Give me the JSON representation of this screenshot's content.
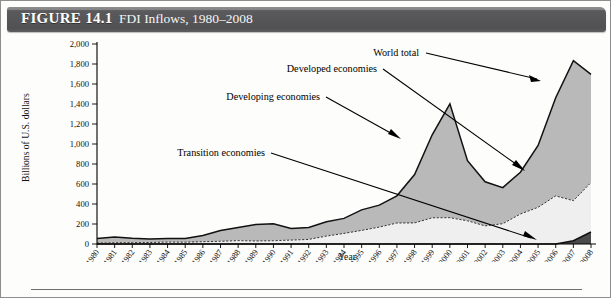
{
  "figure": {
    "label": "FIGURE 14.1",
    "title": "FDI Inflows, 1980–2008"
  },
  "colors": {
    "header_bar": "#58585a",
    "header_text": "#ffffff",
    "developed_band": "#b9b9b9",
    "developing_band": "#efefef",
    "transition_band": "#4a4a4a",
    "line": "#111111",
    "page_background": "#fdfdfb"
  },
  "annotations": {
    "world_total": "World total",
    "developed": "Developed economies",
    "developing": "Developing economies",
    "transition": "Transition economies"
  },
  "chart_data": {
    "type": "area",
    "title": "FDI Inflows, 1980–2008",
    "xlabel": "Year",
    "ylabel": "Billions of U.S. dollars",
    "ylim": [
      0,
      2000
    ],
    "yticks": [
      "0",
      "200",
      "400",
      "600",
      "800",
      "1,000",
      "1,200",
      "1,400",
      "1,600",
      "1,800",
      "2,000"
    ],
    "ytick_values": [
      0,
      200,
      400,
      600,
      800,
      1000,
      1200,
      1400,
      1600,
      1800,
      2000
    ],
    "grid": false,
    "legend": "annotated-labels-with-arrows",
    "x": [
      "1980",
      "1981",
      "1982",
      "1983",
      "1984",
      "1985",
      "1986",
      "1987",
      "1988",
      "1989",
      "1990",
      "1991",
      "1992",
      "1993",
      "1994",
      "1995",
      "1996",
      "1997",
      "1998",
      "1999",
      "2000",
      "2001",
      "2002",
      "2003",
      "2004",
      "2005",
      "2006",
      "2007",
      "2008"
    ],
    "series": [
      {
        "name": "World total",
        "style": "solid-line-upper-boundary",
        "values": [
          55,
          70,
          58,
          50,
          56,
          56,
          86,
          135,
          164,
          196,
          203,
          155,
          166,
          222,
          256,
          341,
          389,
          482,
          694,
          1092,
          1401,
          833,
          622,
          564,
          718,
          986,
          1463,
          1833,
          1697
        ]
      },
      {
        "name": "Developed economies",
        "style": "gray-band-between-solid-and-dashed",
        "values": [
          46,
          58,
          45,
          35,
          37,
          38,
          63,
          108,
          130,
          166,
          170,
          116,
          120,
          143,
          150,
          205,
          220,
          272,
          483,
          830,
          1138,
          601,
          441,
          361,
          418,
          619,
          982,
          1400,
          962
        ]
      },
      {
        "name": "Developing economies",
        "style": "dashed-line-light-fill",
        "values": [
          9,
          12,
          13,
          15,
          19,
          18,
          23,
          27,
          34,
          30,
          33,
          39,
          46,
          79,
          106,
          136,
          169,
          210,
          211,
          262,
          263,
          232,
          181,
          203,
          300,
          367,
          481,
          433,
          615
        ]
      },
      {
        "name": "Transition economies",
        "style": "dark-wedge-at-baseline",
        "values": [
          0,
          0,
          0,
          0,
          0,
          0,
          0,
          0,
          0,
          0,
          0,
          0,
          0,
          0,
          0,
          0,
          0,
          0,
          0,
          0,
          0,
          0,
          0,
          0,
          0,
          0,
          0,
          33,
          120
        ]
      }
    ]
  }
}
